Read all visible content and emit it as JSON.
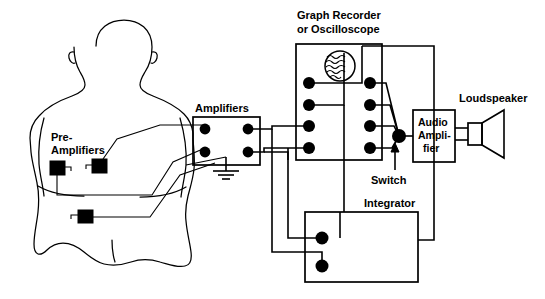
{
  "figure": {
    "background_color": "#ffffff",
    "ink_color": "#000000",
    "width": 545,
    "height": 299
  },
  "labels": {
    "pre_amplifiers": "Pre-\nAmplifiers",
    "pre_amplifiers_line1": "Pre-",
    "pre_amplifiers_line2": "Amplifiers",
    "amplifiers": "Amplifiers",
    "graph_recorder_line1": "Graph Recorder",
    "graph_recorder_line2": "or Oscilloscope",
    "switch": "Switch",
    "audio_amplifier_line1": "Audio",
    "audio_amplifier_line2": "Ampli-",
    "audio_amplifier_line3": "fier",
    "loudspeaker": "Loudspeaker",
    "integrator": "Integrator"
  },
  "components": {
    "subject": {
      "name": "human-subject-torso",
      "description": "Rear view outline of seated human head, shoulders, arms and back"
    },
    "electrodes": [
      {
        "id": "electrode-left",
        "x": 57,
        "y": 168
      },
      {
        "id": "electrode-right",
        "x": 99,
        "y": 166
      },
      {
        "id": "electrode-lower",
        "x": 85,
        "y": 216
      }
    ],
    "amplifiers_box": {
      "x": 193,
      "y": 117,
      "width": 67,
      "height": 48,
      "input_terminals": [
        {
          "x": 205,
          "y": 129
        },
        {
          "x": 205,
          "y": 152
        }
      ],
      "output_terminals": [
        {
          "x": 248,
          "y": 129
        },
        {
          "x": 248,
          "y": 152
        }
      ],
      "ground_symbol": {
        "x": 226,
        "y": 171
      }
    },
    "graph_recorder_box": {
      "x": 296,
      "y": 44,
      "width": 86,
      "height": 116,
      "screen": {
        "cx": 340,
        "cy": 66,
        "r": 15,
        "trace": "wavy-lines"
      },
      "left_terminals": [
        {
          "x": 309,
          "y": 83
        },
        {
          "x": 309,
          "y": 105
        },
        {
          "x": 309,
          "y": 126
        },
        {
          "x": 309,
          "y": 148
        }
      ],
      "right_terminals": [
        {
          "x": 370,
          "y": 83
        },
        {
          "x": 370,
          "y": 105
        },
        {
          "x": 370,
          "y": 126
        },
        {
          "x": 370,
          "y": 148
        }
      ]
    },
    "switch_node": {
      "x": 399,
      "y": 136,
      "r": 6
    },
    "audio_amplifier_box": {
      "x": 413,
      "y": 110,
      "width": 42,
      "height": 52
    },
    "loudspeaker": {
      "x": 462,
      "y": 115,
      "width": 48,
      "height": 42
    },
    "integrator_box": {
      "x": 305,
      "y": 212,
      "width": 113,
      "height": 70,
      "terminals": [
        {
          "x": 322,
          "y": 238
        },
        {
          "x": 322,
          "y": 266
        }
      ]
    }
  },
  "signal_flow": [
    "Electrodes on subject's back feed the pre-amplifiers",
    "Pre-amplifier outputs route to the Amplifiers stage inputs",
    "Amplifiers stage is grounded",
    "Amplifier outputs drive the Graph Recorder or Oscilloscope inputs",
    "Amplifier outputs also drive the Integrator inputs",
    "Integrator output returns to the Graph Recorder",
    "Graph Recorder outputs converge at the Switch",
    "Switch feeds the Audio Amplifier",
    "Audio Amplifier drives the Loudspeaker"
  ]
}
